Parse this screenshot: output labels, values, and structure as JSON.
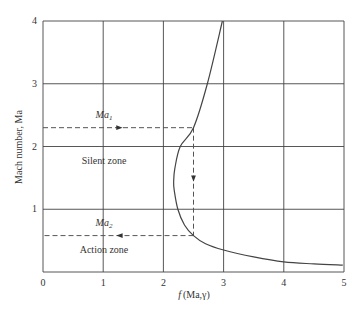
{
  "chart_data": {
    "type": "line",
    "title": "",
    "xlabel": "f (Ma,γ)",
    "ylabel": "Mach number, Ma",
    "xlim": [
      0,
      5
    ],
    "ylim": [
      0,
      4
    ],
    "xticks": [
      "0",
      "1",
      "2",
      "3",
      "4",
      "5"
    ],
    "yticks": [
      "1",
      "2",
      "3",
      "4"
    ],
    "grid": true,
    "series": [
      {
        "name": "f(Ma,γ) curve",
        "points": [
          {
            "f": 4.98,
            "Ma": 0.11
          },
          {
            "f": 4.5,
            "Ma": 0.13
          },
          {
            "f": 4.0,
            "Ma": 0.16
          },
          {
            "f": 3.5,
            "Ma": 0.24
          },
          {
            "f": 3.0,
            "Ma": 0.35
          },
          {
            "f": 2.7,
            "Ma": 0.45
          },
          {
            "f": 2.5,
            "Ma": 0.58
          },
          {
            "f": 2.35,
            "Ma": 0.75
          },
          {
            "f": 2.24,
            "Ma": 1.0
          },
          {
            "f": 2.18,
            "Ma": 1.3
          },
          {
            "f": 2.17,
            "Ma": 1.43
          },
          {
            "f": 2.19,
            "Ma": 1.65
          },
          {
            "f": 2.28,
            "Ma": 2.0
          },
          {
            "f": 2.5,
            "Ma": 2.3
          },
          {
            "f": 2.73,
            "Ma": 3.0
          },
          {
            "f": 2.98,
            "Ma": 4.0
          }
        ]
      }
    ],
    "annotations": [
      {
        "type": "dashed-h",
        "Ma": 2.3,
        "from_f": 0,
        "to_f": 2.5,
        "arrow": "right",
        "label": "Ma1"
      },
      {
        "type": "dashed-v",
        "f": 2.5,
        "from_Ma": 2.3,
        "to_Ma": 0.58,
        "arrow": "down"
      },
      {
        "type": "dashed-h",
        "Ma": 0.58,
        "from_f": 2.5,
        "to_f": 0,
        "arrow": "left",
        "label": "Ma2"
      },
      {
        "type": "text",
        "text": "Silent zone",
        "f": 1.0,
        "Ma": 1.75
      },
      {
        "type": "text",
        "text": "Action zone",
        "f": 1.0,
        "Ma": 0.35
      }
    ]
  },
  "labels": {
    "ylabel": "Mach number, Ma",
    "xlabel_f": "f",
    "xlabel_args": "(Ma,γ)",
    "ma1_main": "Ma",
    "ma1_sub": "1",
    "ma2_main": "Ma",
    "ma2_sub": "2",
    "silent_zone": "Silent zone",
    "action_zone": "Action zone"
  }
}
